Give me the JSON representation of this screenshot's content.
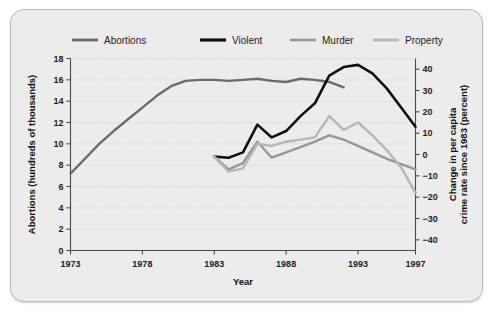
{
  "chart_data": {
    "type": "line",
    "title": "",
    "xlabel": "Year",
    "ylabel": "Abortions (hundreds of thousands)",
    "y2label": "Change in per capita crime rate since 1983 (percent)",
    "xlim": [
      1973,
      1997
    ],
    "ylim": [
      0,
      18
    ],
    "y2lim": [
      -45,
      45
    ],
    "xticks": [
      1973,
      1978,
      1983,
      1988,
      1993,
      1997
    ],
    "xticklabels": [
      "1973",
      "1978",
      "1983",
      "1988",
      "1993",
      "1997"
    ],
    "yticks": [
      0,
      2,
      4,
      6,
      8,
      10,
      12,
      14,
      16,
      18
    ],
    "yticklabels": [
      "0",
      "2",
      "4",
      "6",
      "8",
      "10",
      "12",
      "14",
      "16",
      "18"
    ],
    "y2ticks": [
      -40,
      -30,
      -20,
      -10,
      0,
      10,
      20,
      30,
      40
    ],
    "y2ticklabels": [
      "−40",
      "−30",
      "−20",
      "−10",
      "0",
      "10",
      "20",
      "30",
      "40"
    ],
    "grid": true,
    "grid_axis": "y",
    "legend_position": "top",
    "series": [
      {
        "name": "Abortions",
        "axis": "left",
        "color": "#6b6b6b",
        "width": 2.4,
        "x": [
          1973,
          1974,
          1975,
          1976,
          1977,
          1978,
          1979,
          1980,
          1981,
          1982,
          1983,
          1984,
          1985,
          1986,
          1987,
          1988,
          1989,
          1990,
          1991,
          1992
        ],
        "values": [
          7.2,
          8.6,
          10.0,
          11.2,
          12.3,
          13.4,
          14.5,
          15.4,
          15.9,
          16.0,
          16.0,
          15.9,
          16.0,
          16.1,
          15.9,
          15.8,
          16.1,
          16.0,
          15.8,
          15.3
        ]
      },
      {
        "name": "Violent",
        "axis": "right",
        "color": "#111111",
        "width": 2.6,
        "x": [
          1983,
          1984,
          1985,
          1986,
          1987,
          1988,
          1989,
          1990,
          1991,
          1992,
          1993,
          1994,
          1995,
          1996,
          1997
        ],
        "values": [
          -1.0,
          -1.5,
          1.0,
          14.0,
          8.0,
          11.0,
          18.0,
          24.0,
          37.0,
          41.0,
          42.0,
          38.0,
          31.0,
          22.0,
          13.0
        ]
      },
      {
        "name": "Murder",
        "axis": "right",
        "color": "#979797",
        "width": 2.4,
        "x": [
          1983,
          1984,
          1985,
          1986,
          1987,
          1988,
          1989,
          1990,
          1991,
          1992,
          1993,
          1994,
          1995,
          1996,
          1997
        ],
        "values": [
          -1.0,
          -7.0,
          -4.0,
          6.0,
          -1.5,
          1.0,
          3.5,
          6.0,
          9.0,
          7.0,
          4.0,
          1.0,
          -2.0,
          -4.5,
          -7.0
        ]
      },
      {
        "name": "Property",
        "axis": "right",
        "color": "#b6b6b6",
        "width": 2.4,
        "x": [
          1983,
          1984,
          1985,
          1986,
          1987,
          1988,
          1989,
          1990,
          1991,
          1992,
          1993,
          1994,
          1995,
          1996,
          1997
        ],
        "values": [
          -1.0,
          -8.0,
          -6.5,
          5.0,
          4.0,
          6.0,
          7.0,
          8.0,
          18.0,
          11.5,
          15.0,
          9.0,
          2.0,
          -6.0,
          -18.0
        ]
      }
    ],
    "legend": [
      {
        "label": "Abortions",
        "color": "#6b6b6b",
        "width": 2.8
      },
      {
        "label": "Violent",
        "color": "#111111",
        "width": 3.2
      },
      {
        "label": "Murder",
        "color": "#979797",
        "width": 2.6
      },
      {
        "label": "Property",
        "color": "#b6b6b6",
        "width": 2.6
      }
    ]
  }
}
